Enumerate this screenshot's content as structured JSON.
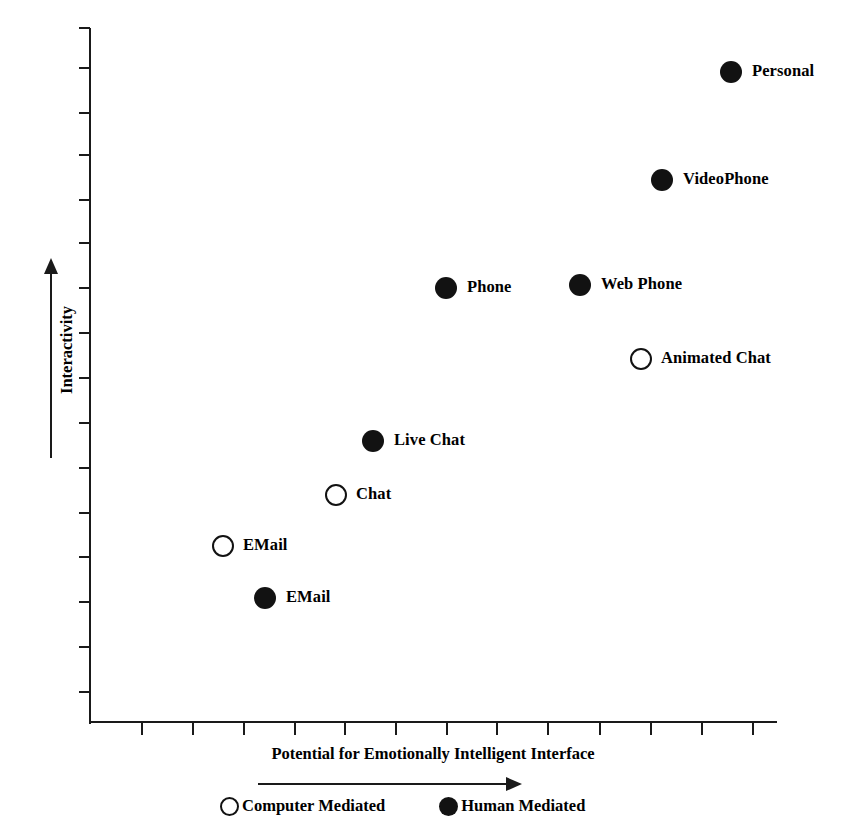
{
  "chart_data": {
    "type": "scatter",
    "title": "",
    "xlabel": "Potential for Emotionally Intelligent Interface",
    "ylabel": "Interactivity",
    "xlim": [
      0,
      10
    ],
    "ylim": [
      0,
      10
    ],
    "grid": false,
    "x_axis_arrow_label": "",
    "y_axis_arrow_label": "",
    "legend_position": "bottom",
    "series": [
      {
        "name": "Computer Mediated",
        "marker": "open-circle",
        "color": "#ffffff",
        "edge_color": "#121212",
        "points": [
          {
            "label": "Animated Chat",
            "x": 7.95,
            "y": 5.25,
            "px": 641,
            "py": 359
          },
          {
            "label": "Chat",
            "x": 3.55,
            "y": 3.27,
            "px": 336,
            "py": 495
          },
          {
            "label": "EMail",
            "x": 1.92,
            "y": 2.54,
            "px": 223,
            "py": 546
          }
        ]
      },
      {
        "name": "Human Mediated",
        "marker": "filled-circle",
        "color": "#121212",
        "edge_color": "#121212",
        "points": [
          {
            "label": "Personal",
            "x": 9.25,
            "y": 9.42,
            "px": 731,
            "py": 72
          },
          {
            "label": "VideoPhone",
            "x": 8.25,
            "y": 7.85,
            "px": 662,
            "py": 180
          },
          {
            "label": "Web Phone",
            "x": 7.06,
            "y": 6.32,
            "px": 580,
            "py": 285
          },
          {
            "label": "Phone",
            "x": 5.11,
            "y": 6.28,
            "px": 446,
            "py": 288
          },
          {
            "label": "Live Chat",
            "x": 4.09,
            "y": 4.06,
            "px": 373,
            "py": 441
          },
          {
            "label": "EMail",
            "x": 2.52,
            "y": 1.79,
            "px": 265,
            "py": 598
          }
        ]
      }
    ],
    "x_ticks_px": [
      142,
      193,
      244,
      295,
      345,
      396,
      447,
      497,
      548,
      600,
      651,
      702,
      753
    ],
    "y_ticks_px": [
      28,
      68,
      113,
      155,
      200,
      243,
      288,
      333,
      378,
      423,
      468,
      513,
      557,
      602,
      647,
      692
    ]
  },
  "axis": {
    "y_title": "Interactivity",
    "x_title": "Potential for Emotionally Intelligent Interface"
  },
  "legend": {
    "items": [
      {
        "label": "Computer Mediated",
        "marker": "open-circle"
      },
      {
        "label": "Human Mediated",
        "marker": "filled-circle"
      }
    ]
  },
  "points": [
    {
      "label": "Personal",
      "marker": "filled-circle",
      "px": 731,
      "py": 72,
      "lx": 752,
      "ly": 63
    },
    {
      "label": "VideoPhone",
      "marker": "filled-circle",
      "px": 662,
      "py": 180,
      "lx": 683,
      "ly": 171
    },
    {
      "label": "Web Phone",
      "marker": "filled-circle",
      "px": 580,
      "py": 285,
      "lx": 601,
      "ly": 276
    },
    {
      "label": "Phone",
      "marker": "filled-circle",
      "px": 446,
      "py": 288,
      "lx": 467,
      "ly": 279
    },
    {
      "label": "Animated Chat",
      "marker": "open-circle",
      "px": 641,
      "py": 359,
      "lx": 661,
      "ly": 350
    },
    {
      "label": "Live Chat",
      "marker": "filled-circle",
      "px": 373,
      "py": 441,
      "lx": 394,
      "ly": 432
    },
    {
      "label": "Chat",
      "marker": "open-circle",
      "px": 336,
      "py": 495,
      "lx": 356,
      "ly": 486
    },
    {
      "label": "EMail",
      "marker": "open-circle",
      "px": 223,
      "py": 546,
      "lx": 243,
      "ly": 537
    },
    {
      "label": "EMail",
      "marker": "filled-circle",
      "px": 265,
      "py": 598,
      "lx": 286,
      "ly": 589
    }
  ]
}
